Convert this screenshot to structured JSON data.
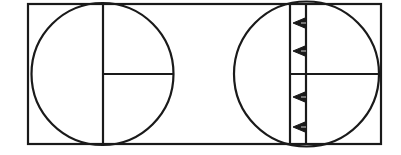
{
  "diagram": {
    "stroke_color": "#1a1a1a",
    "background": "#ffffff",
    "frame": {
      "x": 28,
      "y": 4,
      "width": 353,
      "height": 140
    },
    "left_circle": {
      "cx": 102.5,
      "cy": 74,
      "r": 71,
      "vertical_line": {
        "x": 103,
        "y1": 3,
        "y2": 145
      },
      "horizontal_line": {
        "x1": 103,
        "x2": 174,
        "y": 74
      }
    },
    "right_circle": {
      "cx": 306.5,
      "cy": 74,
      "r": 72.5,
      "strip": {
        "x_left": 290,
        "x_right": 306,
        "y1": 4,
        "y2": 144
      },
      "horizontal_line": {
        "x1": 290,
        "x2": 379,
        "y": 74
      },
      "triangles": [
        {
          "cy": 23,
          "direction": "left"
        },
        {
          "cy": 51,
          "direction": "left"
        },
        {
          "cy": 97,
          "direction": "left"
        },
        {
          "cy": 127,
          "direction": "left"
        }
      ]
    }
  }
}
